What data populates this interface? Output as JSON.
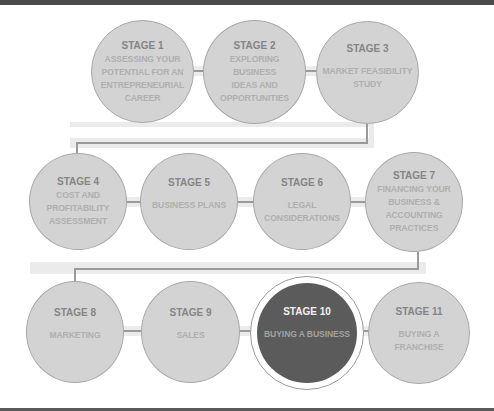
{
  "diagram": {
    "type": "process-flow",
    "stages": [
      {
        "title": "STAGE 1",
        "lines": [
          "ASSESSING YOUR",
          "POTENTIAL FOR AN",
          "ENTREPRENEURIAL",
          "CAREER"
        ],
        "active": false
      },
      {
        "title": "STAGE 2",
        "lines": [
          "EXPLORING",
          "BUSINESS",
          "IDEAS AND",
          "OPPORTUNITIES"
        ],
        "active": false
      },
      {
        "title": "STAGE 3",
        "lines": [
          "MARKET FEASIBILITY",
          "STUDY"
        ],
        "active": false
      },
      {
        "title": "STAGE 4",
        "lines": [
          "COST AND",
          "PROFITABILITY",
          "ASSESSMENT"
        ],
        "active": false
      },
      {
        "title": "STAGE 5",
        "lines": [
          "BUSINESS PLANS"
        ],
        "active": false
      },
      {
        "title": "STAGE 6",
        "lines": [
          "LEGAL",
          "CONSIDERATIONS"
        ],
        "active": false
      },
      {
        "title": "STAGE 7",
        "lines": [
          "FINANCING YOUR",
          "BUSINESS &",
          "ACCOUNTING",
          "PRACTICES"
        ],
        "active": false
      },
      {
        "title": "STAGE 8",
        "lines": [
          "MARKETING"
        ],
        "active": false
      },
      {
        "title": "STAGE 9",
        "lines": [
          "SALES"
        ],
        "active": false
      },
      {
        "title": "STAGE 10",
        "lines": [
          "BUYING A BUSINESS"
        ],
        "active": true
      },
      {
        "title": "STAGE 11",
        "lines": [
          "BUYING A FRANCHISE"
        ],
        "active": false
      }
    ],
    "colors": {
      "inactive_fill": "#d3d3d3",
      "active_fill": "#5b5b5b",
      "connector": "#9a9a9a",
      "border_strip": "#4a4a4a"
    }
  }
}
